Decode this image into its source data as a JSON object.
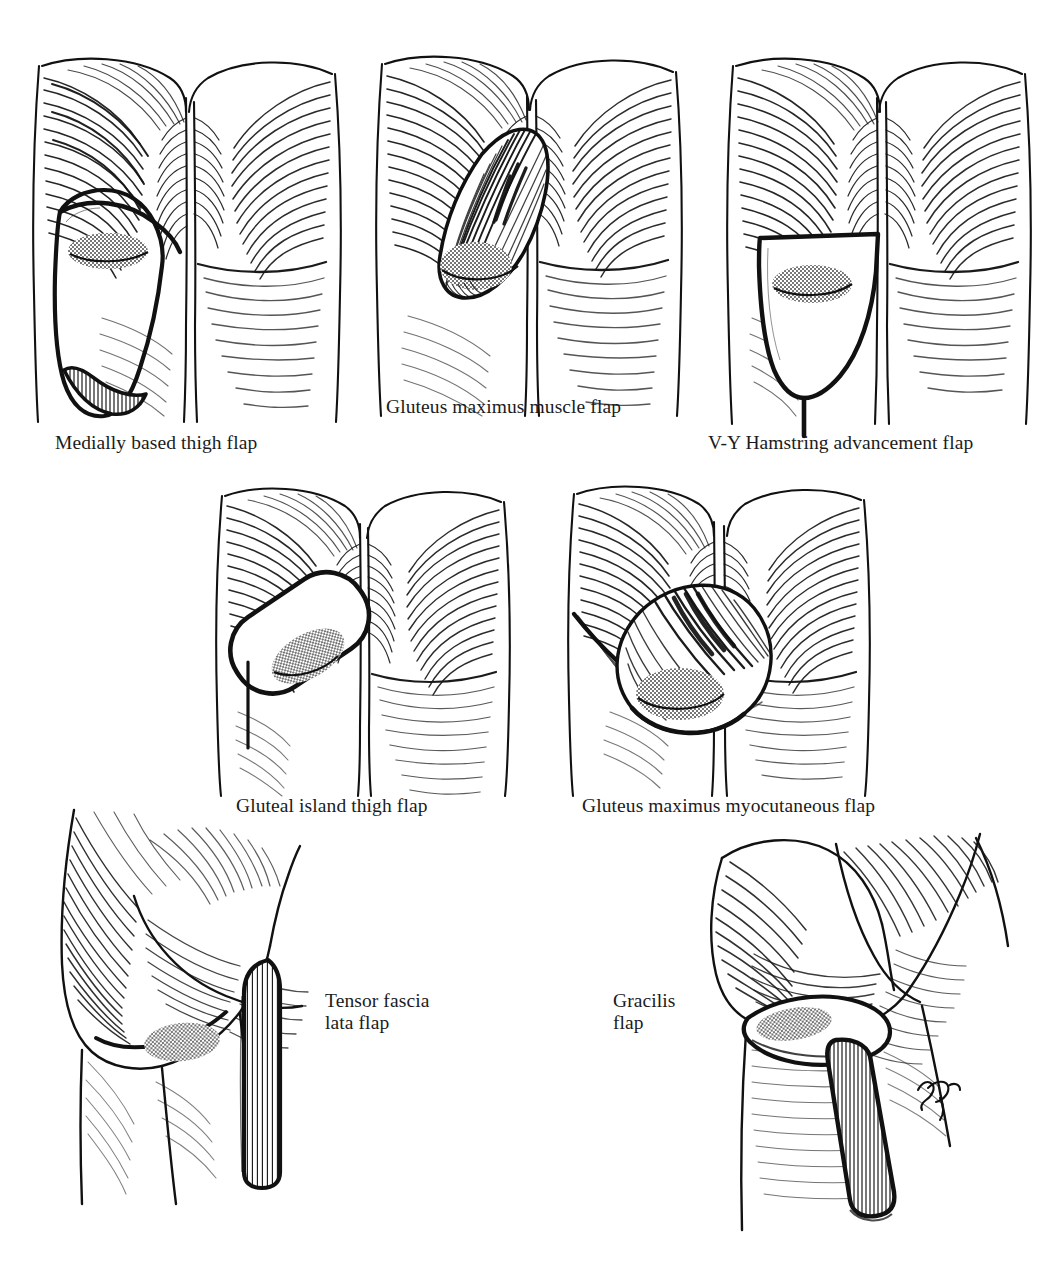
{
  "figure": {
    "background_color": "#ffffff",
    "ink_color": "#111111",
    "stipple_color": "#4a4a4a",
    "artist_signature": "artist-monogram"
  },
  "panels": [
    {
      "id": "medially-based-thigh-flap",
      "caption": "Medially based thigh flap",
      "view": "posterior buttocks and upper thighs",
      "flap_shape": "long vertical ellipse outline on left posterior thigh with hatched distal base",
      "has_stipple_ulcer": true,
      "caption_x": 55,
      "caption_y": 432
    },
    {
      "id": "gluteus-maximus-muscle-flap",
      "caption": "Gluteus maximus muscle flap",
      "view": "posterior buttocks and upper thighs",
      "flap_shape": "teardrop muscle flap rotated from gluteal fold, densely hatched",
      "has_stipple_ulcer": true,
      "caption_x": 386,
      "caption_y": 396
    },
    {
      "id": "v-y-hamstring-advancement-flap",
      "caption": "V-Y Hamstring advancement flap",
      "view": "posterior buttocks and upper thighs",
      "flap_shape": "V-shaped advancement outline with inferior Y limb",
      "has_stipple_ulcer": true,
      "caption_x": 708,
      "caption_y": 432
    },
    {
      "id": "gluteal-island-thigh-flap",
      "caption": "Gluteal island thigh flap",
      "view": "posterior buttocks and upper thighs",
      "flap_shape": "oblique rounded rectangular island paddle on left posterior thigh",
      "has_stipple_ulcer": true,
      "caption_x": 236,
      "caption_y": 795
    },
    {
      "id": "gluteus-maximus-myocutaneous-flap",
      "caption": "Gluteus maximus myocutaneous flap",
      "view": "posterior buttocks and upper thighs",
      "flap_shape": "rounded myocutaneous paddle rotated into gluteal fold, densely hatched",
      "has_stipple_ulcer": true,
      "caption_x": 582,
      "caption_y": 795
    },
    {
      "id": "tensor-fascia-lata-flap",
      "caption": "Tensor fascia\nlata flap",
      "view": "oblique lateral hip and thigh",
      "flap_shape": "long vertically striped lateral thigh strip",
      "has_stipple_ulcer": true,
      "caption_x": 325,
      "caption_y": 990
    },
    {
      "id": "gracilis-flap",
      "caption": "Gracilis\nflap",
      "view": "oblique medial thigh",
      "flap_shape": "long vertically striped medial thigh strip with elliptical skin paddle",
      "has_stipple_ulcer": true,
      "caption_x": 613,
      "caption_y": 990
    }
  ]
}
